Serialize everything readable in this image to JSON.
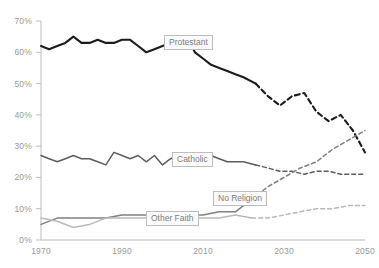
{
  "chart_data": {
    "type": "line",
    "title": "",
    "xlabel": "",
    "ylabel": "",
    "xlim": [
      1970,
      2050
    ],
    "ylim": [
      0,
      70
    ],
    "grid": false,
    "legend_position": "inline-labels",
    "y_tick_labels": [
      "70%",
      "60%",
      "50%",
      "40%",
      "30%",
      "20%",
      "10%",
      "0%"
    ],
    "y_ticks": [
      70,
      60,
      50,
      40,
      30,
      20,
      10,
      0
    ],
    "x_tick_labels": [
      "1970",
      "1990",
      "2010",
      "2030",
      "2050"
    ],
    "x_ticks": [
      1970,
      1990,
      2010,
      2030,
      2050
    ],
    "projection_start": 2023,
    "note": "Solid segments are historical data; dashed segments are projections.",
    "series": [
      {
        "name": "Protestant",
        "color": "#1c1c1c",
        "label_x": 164,
        "label_y": 35,
        "x": [
          1970,
          1972,
          1974,
          1976,
          1978,
          1980,
          1982,
          1984,
          1986,
          1988,
          1990,
          1992,
          1994,
          1996,
          1998,
          2000,
          2002,
          2004,
          2006,
          2008,
          2010,
          2012,
          2014,
          2016,
          2018,
          2020,
          2023,
          2026,
          2029,
          2032,
          2035,
          2038,
          2041,
          2044,
          2047,
          2050
        ],
        "values": [
          62,
          61,
          62,
          63,
          65,
          63,
          63,
          64,
          63,
          63,
          64,
          64,
          62,
          60,
          61,
          62,
          63,
          62,
          65,
          60,
          58,
          56,
          55,
          54,
          53,
          52,
          50,
          46,
          43,
          46,
          47,
          41,
          38,
          40,
          35,
          28
        ]
      },
      {
        "name": "Catholic",
        "color": "#5d5d5d",
        "label_x": 172,
        "label_y": 152,
        "x": [
          1970,
          1972,
          1974,
          1976,
          1978,
          1980,
          1982,
          1984,
          1986,
          1988,
          1990,
          1992,
          1994,
          1996,
          1998,
          2000,
          2002,
          2004,
          2006,
          2008,
          2010,
          2012,
          2014,
          2016,
          2018,
          2020,
          2023,
          2026,
          2029,
          2032,
          2035,
          2038,
          2041,
          2044,
          2047,
          2050
        ],
        "values": [
          27,
          26,
          25,
          26,
          27,
          26,
          26,
          25,
          24,
          28,
          27,
          26,
          27,
          25,
          27,
          24,
          26,
          27,
          27,
          26,
          27,
          27,
          26,
          25,
          25,
          25,
          24,
          23,
          22,
          22,
          21,
          22,
          22,
          21,
          21,
          21
        ]
      },
      {
        "name": "No Religion",
        "color": "#808080",
        "label_x": 213,
        "label_y": 191,
        "x": [
          1970,
          1974,
          1978,
          1982,
          1986,
          1990,
          1994,
          1998,
          2002,
          2006,
          2010,
          2014,
          2018,
          2022,
          2026,
          2030,
          2034,
          2038,
          2042,
          2046,
          2050
        ],
        "values": [
          5,
          7,
          7,
          7,
          7,
          8,
          8,
          8,
          8,
          8,
          8,
          9,
          9,
          13,
          17,
          20,
          23,
          25,
          29,
          32,
          35
        ]
      },
      {
        "name": "Other Faith",
        "color": "#b9b9b9",
        "label_x": 146,
        "label_y": 211,
        "x": [
          1970,
          1974,
          1978,
          1982,
          1986,
          1990,
          1994,
          1998,
          2002,
          2006,
          2010,
          2014,
          2018,
          2022,
          2026,
          2030,
          2034,
          2038,
          2042,
          2046,
          2050
        ],
        "values": [
          7,
          6,
          4,
          5,
          7,
          7,
          7,
          7,
          7,
          7,
          7,
          7,
          8,
          7,
          7,
          8,
          9,
          10,
          10,
          11,
          11
        ]
      }
    ]
  }
}
